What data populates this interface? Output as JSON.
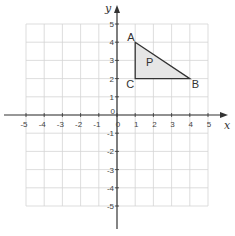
{
  "diagram": {
    "type": "coordinate-grid",
    "x_axis": {
      "label": "x",
      "min": -5,
      "max": 5,
      "ticks": [
        "-5",
        "-4",
        "-3",
        "-2",
        "-1",
        "0",
        "1",
        "2",
        "3",
        "4",
        "5"
      ]
    },
    "y_axis": {
      "label": "y",
      "min": -5,
      "max": 5,
      "ticks": [
        "-5",
        "-4",
        "-3",
        "-2",
        "-1",
        "0",
        "1",
        "2",
        "3",
        "4",
        "5"
      ]
    },
    "shape": {
      "name": "P",
      "fill": "#e6e6e6",
      "vertices": [
        {
          "label": "A",
          "x": 1,
          "y": 4
        },
        {
          "label": "B",
          "x": 4,
          "y": 2
        },
        {
          "label": "C",
          "x": 1,
          "y": 2
        }
      ]
    },
    "colors": {
      "grid": "#d4d4d4",
      "axis": "#333333",
      "triangle_stroke": "#333333"
    }
  }
}
